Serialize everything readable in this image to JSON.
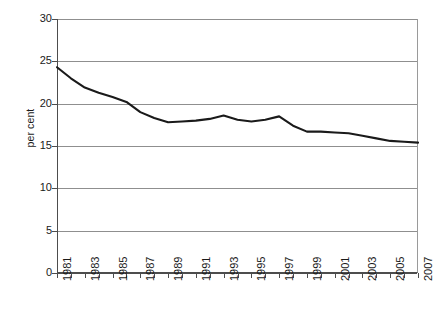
{
  "chart_data": {
    "type": "line",
    "title": "",
    "subtitle": "",
    "xlabel": "",
    "ylabel": "per cent",
    "ylim": [
      0,
      30
    ],
    "ytick_values": [
      0,
      5,
      10,
      15,
      20,
      25,
      30
    ],
    "ytick_labels": [
      "0",
      "5",
      "10",
      "15",
      "20",
      "25",
      "30"
    ],
    "grid": "horizontal",
    "legend": "none",
    "xlim": [
      1981,
      2007
    ],
    "x": [
      1981,
      1982,
      1983,
      1984,
      1985,
      1986,
      1987,
      1988,
      1989,
      1990,
      1991,
      1992,
      1993,
      1994,
      1995,
      1996,
      1997,
      1998,
      1999,
      2000,
      2001,
      2002,
      2003,
      2004,
      2005,
      2006,
      2007
    ],
    "xtick_labels": [
      "1981",
      "1983",
      "1985",
      "1987",
      "1989",
      "1991",
      "1993",
      "1995",
      "1997",
      "1999",
      "2001",
      "2003",
      "2005",
      "2007"
    ],
    "xtick_label_interval": 2,
    "series": [
      {
        "name": "per cent",
        "color": "#1a1a1a",
        "values": [
          24.3,
          23.0,
          21.9,
          21.3,
          20.8,
          20.2,
          19.0,
          18.3,
          17.8,
          17.9,
          18.0,
          18.2,
          18.6,
          18.1,
          17.9,
          18.1,
          18.5,
          17.4,
          16.7,
          16.7,
          16.6,
          16.5,
          16.2,
          15.9,
          15.6,
          15.5,
          15.4
        ]
      }
    ],
    "annotations": []
  },
  "figure": {
    "axis_color": "#4d4d4d",
    "grid_color": "#8f8f8f",
    "line_color": "#1a1a1a",
    "background": "#ffffff"
  }
}
